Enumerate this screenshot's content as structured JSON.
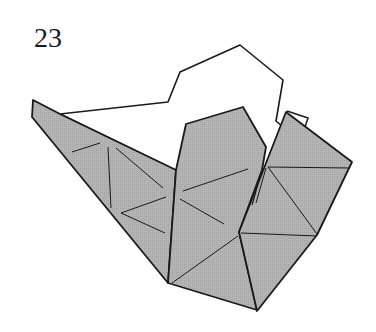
{
  "step": {
    "number": "23"
  },
  "diagram": {
    "colors": {
      "paper_shaded": "#b3b3b3",
      "paper_white": "#ffffff",
      "line": "#1a1a1a"
    }
  }
}
